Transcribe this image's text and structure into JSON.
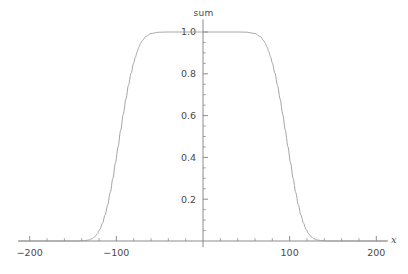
{
  "chart_data": {
    "type": "line",
    "title": "sum",
    "xlabel": "x",
    "ylabel": "",
    "xlim": [
      -213,
      213
    ],
    "ylim": [
      -0.03,
      1.06
    ],
    "grid": false,
    "legend": null,
    "xticks": [
      -200,
      -100,
      100,
      200
    ],
    "xtick_labels": [
      "-200",
      "-100",
      "100",
      "200"
    ],
    "yticks": [
      0.2,
      0.4,
      0.6,
      0.8,
      1.0
    ],
    "ytick_labels": [
      "0.2",
      "0.4",
      "0.6",
      "0.8",
      "1.0"
    ],
    "x_minor_tick_step": 20,
    "y_minor_tick_step": 0.05,
    "series": [
      {
        "name": "sum",
        "color": "#9a9a9a",
        "line_width": 0.9,
        "x": [
          -213,
          -200,
          -190,
          -180,
          -170,
          -160,
          -155,
          -150,
          -145,
          -140,
          -136,
          -132,
          -128,
          -125,
          -122,
          -119,
          -116,
          -113,
          -110,
          -107,
          -104,
          -101,
          -98,
          -95,
          -92,
          -89,
          -86,
          -83,
          -80,
          -78,
          -76,
          -74,
          -72,
          -70,
          -66,
          -60,
          -50,
          -40,
          -30,
          -20,
          -10,
          0,
          10,
          20,
          30,
          40,
          50,
          60,
          66,
          70,
          72,
          74,
          76,
          78,
          80,
          83,
          86,
          89,
          92,
          95,
          98,
          101,
          104,
          107,
          110,
          113,
          116,
          119,
          122,
          125,
          128,
          132,
          136,
          140,
          145,
          150,
          155,
          160,
          170,
          180,
          190,
          200,
          213
        ],
        "y": [
          0.0,
          0.0,
          0.0,
          0.0,
          0.0,
          0.0,
          0.0,
          0.0,
          0.0,
          0.001,
          0.002,
          0.005,
          0.011,
          0.02,
          0.034,
          0.055,
          0.085,
          0.124,
          0.173,
          0.232,
          0.3,
          0.374,
          0.451,
          0.53,
          0.607,
          0.679,
          0.745,
          0.803,
          0.852,
          0.88,
          0.905,
          0.927,
          0.945,
          0.959,
          0.979,
          0.993,
          0.999,
          1.0,
          1.0,
          1.0,
          1.0,
          1.0,
          1.0,
          1.0,
          1.0,
          1.0,
          0.999,
          0.993,
          0.979,
          0.959,
          0.945,
          0.927,
          0.905,
          0.88,
          0.852,
          0.803,
          0.745,
          0.679,
          0.607,
          0.53,
          0.451,
          0.374,
          0.3,
          0.232,
          0.173,
          0.124,
          0.085,
          0.055,
          0.034,
          0.02,
          0.011,
          0.005,
          0.002,
          0.001,
          0.0,
          0.0,
          0.0,
          0.0,
          0.0,
          0.0,
          0.0,
          0.0,
          0.0
        ],
        "plateau_start": -72,
        "plateau_end": 72,
        "plateau_value": 1.0,
        "rise_midpoint": -95,
        "fall_midpoint": 95
      }
    ],
    "axes": {
      "x_axis_position_y": 0.0,
      "y_axis_position_x": 0.0,
      "axis_color": "#808080",
      "tick_label_color": "#4a4a4a"
    }
  }
}
